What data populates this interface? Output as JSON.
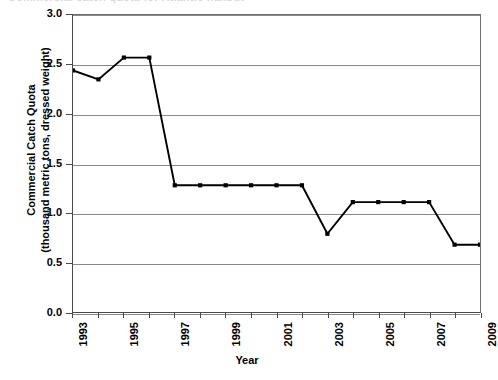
{
  "caption": {
    "clipped_text": "Commercial catch quota for Atlantic halibut"
  },
  "chart_data": {
    "type": "line",
    "title": "",
    "xlabel": "Year",
    "ylabel": "Commercial Catch Quota (thousand metric tons, dressed weight)",
    "ylabel_line1": "Commercial Catch Quota",
    "ylabel_line2": "(thousand metric tons, dressed weight)",
    "x": [
      1993,
      1994,
      1995,
      1996,
      1997,
      1998,
      1999,
      2000,
      2001,
      2002,
      2003,
      2004,
      2005,
      2006,
      2007,
      2008,
      2009
    ],
    "values": [
      2.44,
      2.35,
      2.57,
      2.57,
      1.28,
      1.28,
      1.28,
      1.28,
      1.28,
      1.28,
      0.79,
      1.11,
      1.11,
      1.11,
      1.11,
      0.68,
      0.68
    ],
    "xlim": [
      1993,
      2009
    ],
    "ylim": [
      0.0,
      3.0
    ],
    "ytick_labels": [
      "0.0",
      "0.5",
      "1.0",
      "1.5",
      "2.0",
      "2.5",
      "3.0"
    ],
    "ytick_values": [
      0.0,
      0.5,
      1.0,
      1.5,
      2.0,
      2.5,
      3.0
    ],
    "xtick_values": [
      1993,
      1994,
      1995,
      1996,
      1997,
      1998,
      1999,
      2000,
      2001,
      2002,
      2003,
      2004,
      2005,
      2006,
      2007,
      2008,
      2009
    ],
    "xtick_labels_shown": [
      "1993",
      "",
      "1995",
      "",
      "1997",
      "",
      "1999",
      "",
      "2001",
      "",
      "2003",
      "",
      "2005",
      "",
      "2007",
      "",
      "2009"
    ],
    "grid": true,
    "grid_axis": "y",
    "legend": false,
    "marker": "square",
    "line_color": "#000000",
    "grid_color": "#8a8a8a",
    "axis_color": "#4a4a4a",
    "background": "#ffffff"
  }
}
